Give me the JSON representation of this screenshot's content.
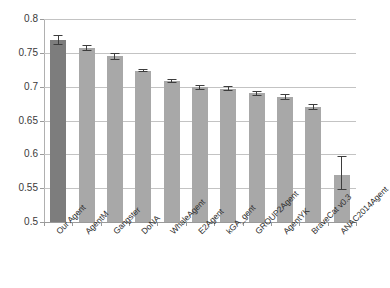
{
  "chart_data": {
    "type": "bar",
    "title": "",
    "xlabel": "",
    "ylabel": "",
    "ylim": [
      0.5,
      0.8
    ],
    "ytick_step": 0.05,
    "yticks": [
      "0.5",
      "0.55",
      "0.6",
      "0.65",
      "0.7",
      "0.75",
      "0.8"
    ],
    "ytick_values": [
      0.5,
      0.55,
      0.6,
      0.65,
      0.7,
      0.75,
      0.8
    ],
    "grid": "horizontal",
    "legend": "none",
    "categories": [
      "Our Agent",
      "AgentM",
      "Gangster",
      "DoNA",
      "WhaleAgent",
      "E2Agent",
      "kGA_gent",
      "GROUP2Agent",
      "AgentYK",
      "BraveCat v0.3",
      "ANAC2014Agent"
    ],
    "values": [
      0.769,
      0.757,
      0.745,
      0.723,
      0.708,
      0.699,
      0.697,
      0.69,
      0.685,
      0.67,
      0.57
    ],
    "errors_low": [
      0.762,
      0.753,
      0.74,
      0.721,
      0.705,
      0.695,
      0.693,
      0.686,
      0.681,
      0.666,
      0.548
    ],
    "errors_high": [
      0.776,
      0.761,
      0.75,
      0.726,
      0.711,
      0.703,
      0.701,
      0.694,
      0.689,
      0.674,
      0.598
    ],
    "highlight_index": 0,
    "colors": {
      "bar": "#a8a8a8",
      "bar_highlight": "#7d7d7d",
      "error": "#3d3d3d",
      "grid": "#c3c3c3",
      "axis": "#9a9a9a",
      "text": "#2e2e2e",
      "background": "#ffffff"
    }
  }
}
